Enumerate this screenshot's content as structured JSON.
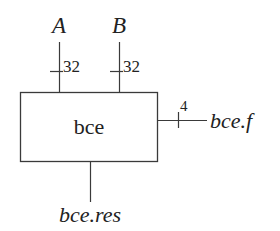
{
  "diagram": {
    "type": "block-diagram",
    "block": {
      "label": "bce"
    },
    "inputs": [
      {
        "name": "A",
        "width": "32"
      },
      {
        "name": "B",
        "width": "32"
      }
    ],
    "outputs": [
      {
        "name": "bce.f",
        "width": "4",
        "side": "right"
      },
      {
        "name": "bce.res",
        "side": "bottom"
      }
    ],
    "colors": {
      "line": "#3a3a3a",
      "text": "#222222",
      "background": "#ffffff"
    }
  }
}
